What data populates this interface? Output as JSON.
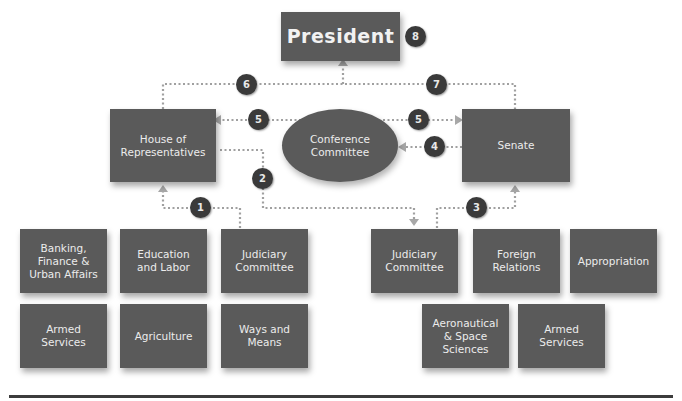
{
  "diagram": {
    "president": {
      "label": "President",
      "step": "8"
    },
    "house": {
      "label": "House of\nRepresentatives"
    },
    "senate": {
      "label": "Senate"
    },
    "conference": {
      "label": "Conference\nCommittee"
    },
    "steps": {
      "s1": "1",
      "s2": "2",
      "s3": "3",
      "s4": "4",
      "s5a": "5",
      "s5b": "5",
      "s6": "6",
      "s7": "7",
      "s8": "8"
    },
    "house_committees": [
      {
        "label": "Banking,\nFinance &\nUrban Affairs"
      },
      {
        "label": "Education\nand Labor"
      },
      {
        "label": "Judiciary\nCommittee"
      },
      {
        "label": "Armed\nServices"
      },
      {
        "label": "Agriculture"
      },
      {
        "label": "Ways and\nMeans"
      }
    ],
    "senate_committees": [
      {
        "label": "Judiciary\nCommittee"
      },
      {
        "label": "Foreign\nRelations"
      },
      {
        "label": "Appropriation"
      },
      {
        "label": "Aeronautical\n& Space\nSciences"
      },
      {
        "label": "Armed\nServices"
      }
    ],
    "colors": {
      "box": "#5a5a5a",
      "badge": "#3a3a3a",
      "connector": "#9a9a9a",
      "text": "#ececec"
    }
  }
}
